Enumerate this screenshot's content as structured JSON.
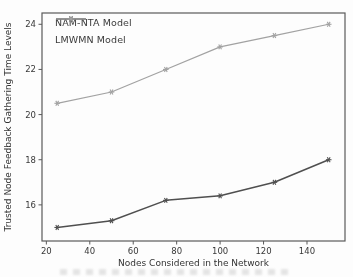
{
  "figure": {
    "kind": "scanned-line-chart"
  },
  "chart_data": {
    "type": "line",
    "x": [
      25,
      50,
      75,
      100,
      125,
      150
    ],
    "series": [
      {
        "name": "NAM-NTA Model",
        "values": [
          15.0,
          15.3,
          16.2,
          16.4,
          17.0,
          18.0
        ],
        "color": "#4f4f4f",
        "line_width": 1.5,
        "marker": "asterisk"
      },
      {
        "name": "LMWMN Model",
        "values": [
          20.5,
          21.0,
          22.0,
          23.0,
          23.5,
          24.0
        ],
        "color": "#a2a2a2",
        "line_width": 1.2,
        "marker": "asterisk"
      }
    ],
    "title": "",
    "xlabel": "Nodes Considered in the Network",
    "ylabel": "Trusted Node Feedback Gathering Time Levels",
    "xticks": [
      20,
      40,
      60,
      80,
      100,
      120,
      140
    ],
    "yticks": [
      16,
      18,
      20,
      22,
      24
    ],
    "xlim": [
      18,
      157.5
    ],
    "ylim": [
      14.4,
      24.5
    ],
    "grid": false,
    "legend_position": "upper-left",
    "axis_color": "#5a5a5a",
    "tick_label_color": "#383838",
    "axis_label_color": "#333333"
  }
}
